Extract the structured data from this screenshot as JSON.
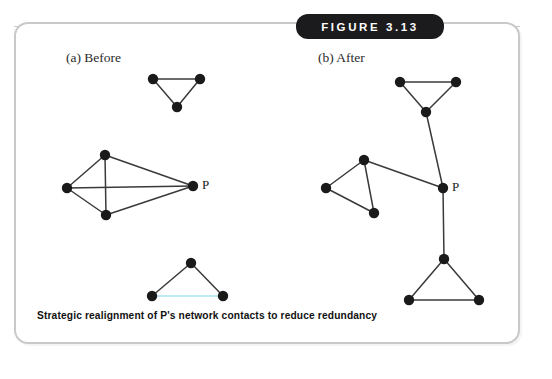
{
  "figure": {
    "badge_label": "FIGURE 3.13",
    "caption": "Strategic realignment of P's network contacts to reduce redundancy",
    "frame_border_color": "#c9c9cb",
    "badge_background": "#1b1b1d",
    "badge_text_color": "#ffffff",
    "background": "#ffffff"
  },
  "panels": [
    {
      "id": "a",
      "label": "(a)  Before"
    },
    {
      "id": "b",
      "label": "(b)  After"
    }
  ],
  "diagram": {
    "node_color": "#1a1a1a",
    "node_radius": 5.2,
    "edge_color": "#3a3a3a",
    "edge_width": 1.5,
    "highlight_edge_color": "#bfe9f2",
    "focal_node_label": "P"
  },
  "chart_data": {
    "type": "diagram",
    "title": "Strategic realignment of P's network contacts to reduce redundancy",
    "subtype": "node-link-network",
    "panels": [
      {
        "id": "a",
        "label": "(a)  Before",
        "description": "P sits inside a single dense redundant cluster; two other triangles are unconnected to P.",
        "nodes": [
          {
            "id": "a1",
            "x": 153,
            "y": 79,
            "label": ""
          },
          {
            "id": "a2",
            "x": 200,
            "y": 79,
            "label": ""
          },
          {
            "id": "a3",
            "x": 177,
            "y": 107,
            "label": ""
          },
          {
            "id": "a4",
            "x": 67,
            "y": 188,
            "label": ""
          },
          {
            "id": "a5",
            "x": 105,
            "y": 155,
            "label": ""
          },
          {
            "id": "a6",
            "x": 106,
            "y": 215,
            "label": ""
          },
          {
            "id": "aP",
            "x": 193,
            "y": 186,
            "label": "P"
          },
          {
            "id": "a7",
            "x": 191,
            "y": 263,
            "label": ""
          },
          {
            "id": "a8",
            "x": 152,
            "y": 296,
            "label": ""
          },
          {
            "id": "a9",
            "x": 223,
            "y": 296,
            "label": ""
          }
        ],
        "edges": [
          {
            "from": "a1",
            "to": "a2",
            "style": "plain"
          },
          {
            "from": "a1",
            "to": "a3",
            "style": "plain"
          },
          {
            "from": "a2",
            "to": "a3",
            "style": "plain"
          },
          {
            "from": "a4",
            "to": "a5",
            "style": "plain"
          },
          {
            "from": "a4",
            "to": "a6",
            "style": "plain"
          },
          {
            "from": "a5",
            "to": "a6",
            "style": "plain"
          },
          {
            "from": "a4",
            "to": "aP",
            "style": "plain"
          },
          {
            "from": "a5",
            "to": "aP",
            "style": "plain"
          },
          {
            "from": "a6",
            "to": "aP",
            "style": "plain"
          },
          {
            "from": "a7",
            "to": "a8",
            "style": "plain"
          },
          {
            "from": "a7",
            "to": "a9",
            "style": "plain"
          },
          {
            "from": "a8",
            "to": "a9",
            "style": "highlight"
          }
        ]
      },
      {
        "id": "b",
        "label": "(b)  After",
        "description": "P brokers three separate triangle clusters through single non-redundant bridging ties.",
        "nodes": [
          {
            "id": "b1",
            "x": 400,
            "y": 82,
            "label": ""
          },
          {
            "id": "b2",
            "x": 456,
            "y": 82,
            "label": ""
          },
          {
            "id": "b3",
            "x": 426,
            "y": 112,
            "label": ""
          },
          {
            "id": "b4",
            "x": 326,
            "y": 188,
            "label": ""
          },
          {
            "id": "b5",
            "x": 364,
            "y": 160,
            "label": ""
          },
          {
            "id": "b6",
            "x": 374,
            "y": 213,
            "label": ""
          },
          {
            "id": "bP",
            "x": 443,
            "y": 188,
            "label": "P"
          },
          {
            "id": "b7",
            "x": 444,
            "y": 259,
            "label": ""
          },
          {
            "id": "b8",
            "x": 409,
            "y": 300,
            "label": ""
          },
          {
            "id": "b9",
            "x": 479,
            "y": 300,
            "label": ""
          }
        ],
        "edges": [
          {
            "from": "b1",
            "to": "b2",
            "style": "plain"
          },
          {
            "from": "b1",
            "to": "b3",
            "style": "plain"
          },
          {
            "from": "b2",
            "to": "b3",
            "style": "plain"
          },
          {
            "from": "b3",
            "to": "bP",
            "style": "plain"
          },
          {
            "from": "b4",
            "to": "b5",
            "style": "plain"
          },
          {
            "from": "b4",
            "to": "b6",
            "style": "plain"
          },
          {
            "from": "b5",
            "to": "b6",
            "style": "plain"
          },
          {
            "from": "b5",
            "to": "bP",
            "style": "plain"
          },
          {
            "from": "bP",
            "to": "b7",
            "style": "plain"
          },
          {
            "from": "b7",
            "to": "b8",
            "style": "plain"
          },
          {
            "from": "b7",
            "to": "b9",
            "style": "plain"
          },
          {
            "from": "b8",
            "to": "b9",
            "style": "plain"
          }
        ]
      }
    ]
  }
}
